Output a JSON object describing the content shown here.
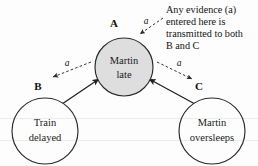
{
  "diagram": {
    "canvas": {
      "width": 258,
      "height": 166
    },
    "colors": {
      "shaded_node_fill": "#dedede",
      "plain_node_fill": "#fdfdfd",
      "node_stroke": "#2a2a2a",
      "edge_solid": "#1f1f1f",
      "edge_dashed": "#333333",
      "text": "#121212",
      "background": "#fdfdfd"
    },
    "nodes": [
      {
        "id": "A",
        "tag": "A",
        "line1": "Martin",
        "line2": "late",
        "cx": 124,
        "cy": 67,
        "r": 29,
        "shaded": true,
        "tag_x": 114,
        "tag_y": 24
      },
      {
        "id": "B",
        "tag": "B",
        "line1": "Train",
        "line2": "delayed",
        "cx": 45,
        "cy": 131,
        "r": 33,
        "shaded": false,
        "tag_x": 38,
        "tag_y": 87
      },
      {
        "id": "C",
        "tag": "C",
        "line1": "Martin",
        "line2": "oversleeps",
        "cx": 212,
        "cy": 131,
        "r": 33,
        "shaded": false,
        "tag_x": 199,
        "tag_y": 87
      }
    ],
    "edges": [
      {
        "id": "B-to-A",
        "from": "B",
        "to": "A",
        "style": "solid"
      },
      {
        "id": "C-to-A",
        "from": "C",
        "to": "A",
        "style": "solid"
      }
    ],
    "evidence_flows": [
      {
        "id": "evidence-in-A",
        "label": "a",
        "label_x": 146,
        "label_y": 22,
        "style": "dashed"
      },
      {
        "id": "evidence-A-to-B",
        "label": "a",
        "label_x": 67,
        "label_y": 64,
        "style": "dashed"
      },
      {
        "id": "evidence-A-to-C",
        "label": "a",
        "label_x": 179,
        "label_y": 64,
        "style": "dashed"
      }
    ],
    "annotation": {
      "id": "evidence-note",
      "x": 166,
      "y": 10,
      "line_height": 11.6,
      "lines": [
        "Any evidence (a)",
        "entered here is",
        "transmitted to both",
        "B and C"
      ]
    }
  }
}
